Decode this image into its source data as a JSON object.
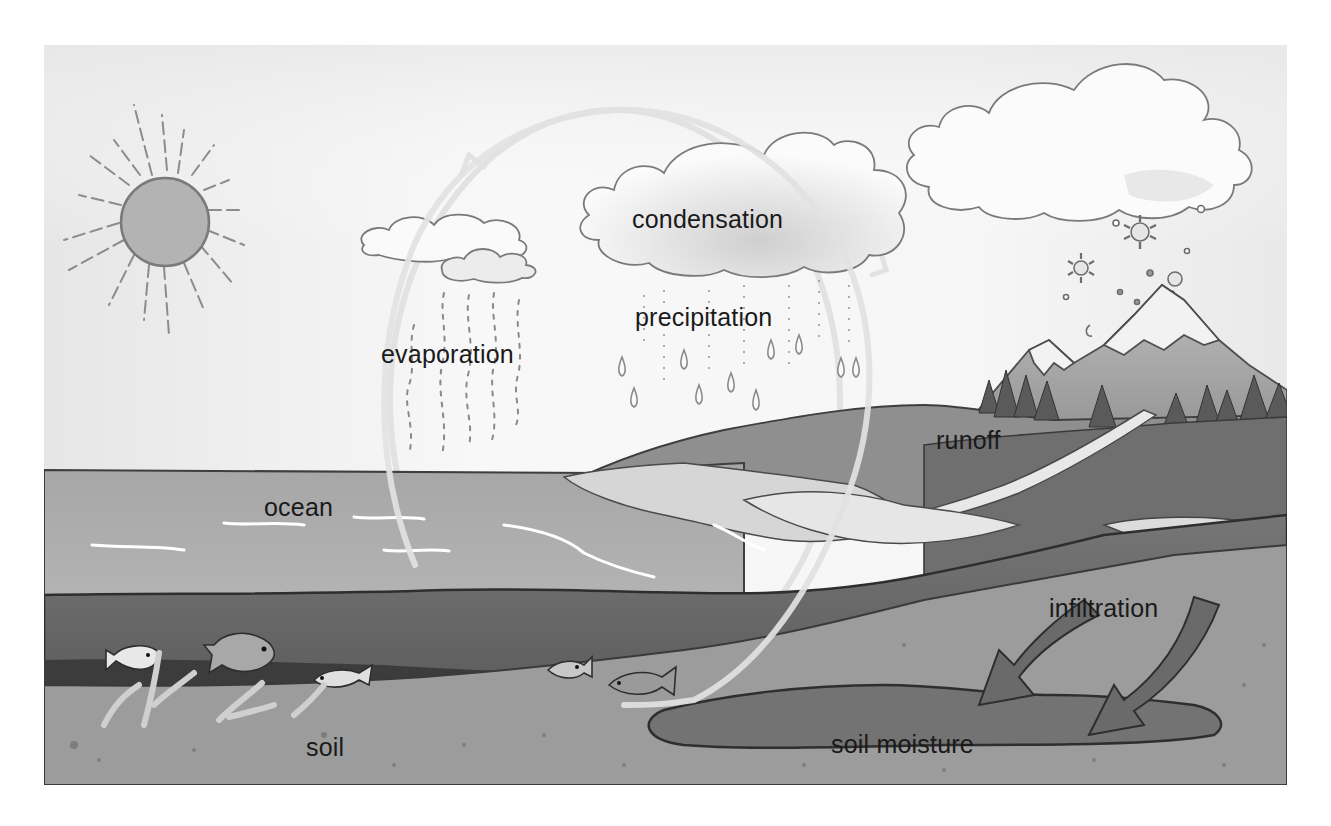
{
  "diagram": {
    "style": "grayscale watercolor illustration",
    "labels": {
      "condensation": "condensation",
      "precipitation": "precipitation",
      "evaporation": "evaporation",
      "runoff": "runoff",
      "ocean": "ocean",
      "infiltration": "infiltration",
      "soil": "soil",
      "soil_moisture": "soil moisture"
    },
    "elements": [
      {
        "name": "sun",
        "position": "upper-left"
      },
      {
        "name": "small-clouds",
        "position": "upper-center-left"
      },
      {
        "name": "rain-cloud",
        "position": "upper-center"
      },
      {
        "name": "snow-cloud",
        "position": "upper-right"
      },
      {
        "name": "snowflakes",
        "position": "right, below snow cloud"
      },
      {
        "name": "snow-capped-mountains",
        "position": "right"
      },
      {
        "name": "pine-forest",
        "position": "right, base of mountains"
      },
      {
        "name": "river-runoff",
        "position": "right, flowing toward ocean"
      },
      {
        "name": "ocean-with-fish",
        "position": "left"
      },
      {
        "name": "seaweed",
        "position": "ocean floor"
      },
      {
        "name": "infiltration-arrows",
        "count": 2,
        "position": "lower-right"
      },
      {
        "name": "cycle-circle-arrows",
        "direction": "clockwise"
      }
    ],
    "colors": {
      "sky": "#f4f4f4",
      "ocean_surface": "#a8a8a8",
      "ocean_deep": "#6e6e6e",
      "ocean_floor": "#3e3e3e",
      "soil": "#9a9a9a",
      "soil_moisture": "#6a6a6a",
      "land": "#8a8a8a",
      "cycle_arrow": "#e4e4e4",
      "text": "#1a1a1a"
    }
  }
}
